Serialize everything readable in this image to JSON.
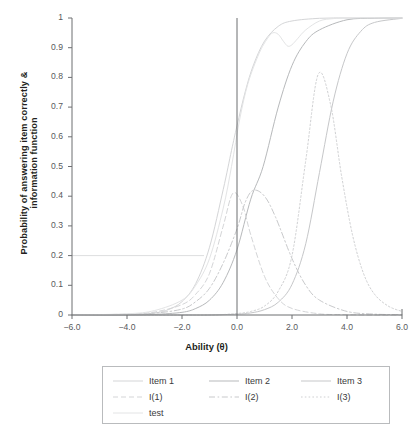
{
  "chart_data": {
    "type": "line",
    "title": "",
    "xlabel": "Ability (θ)",
    "ylabel": "Probability of answering item correctly & information function",
    "xlim": [
      -6.0,
      6.0
    ],
    "ylim": [
      0,
      1
    ],
    "xticks": [
      "-6.0",
      "-4.0",
      "-2.0",
      "0.0",
      "2.0",
      "4.0",
      "6.0"
    ],
    "xtick_values": [
      -6.0,
      -4.0,
      -2.0,
      0.0,
      2.0,
      4.0,
      6.0
    ],
    "yticks": [
      "0",
      "0.1",
      "0.2",
      "0.3",
      "0.4",
      "0.5",
      "0.6",
      "0.7",
      "0.8",
      "0.9",
      "1"
    ],
    "ytick_values": [
      0,
      0.1,
      0.2,
      0.3,
      0.4,
      0.5,
      0.6,
      0.7,
      0.8,
      0.9,
      1
    ],
    "grid": false,
    "legend_position": "bottom",
    "reference_lines": [
      {
        "name": "theta-zero-vertical",
        "orientation": "vertical",
        "value": 0.0,
        "color": "#6d6e71"
      },
      {
        "name": "probability-0.2-horizontal",
        "orientation": "horizontal",
        "value": 0.2,
        "x_from": -6.0,
        "x_to": -1.2,
        "color": "#d9dadb"
      }
    ],
    "series": [
      {
        "name": "Item 1",
        "style": "solid",
        "color": "#d4d5d7",
        "model": "2pl",
        "a": 1.8,
        "b": -0.15,
        "c": 0.0,
        "x": [
          -6.0,
          -5.0,
          -4.0,
          -3.0,
          -2.5,
          -2.0,
          -1.5,
          -1.0,
          -0.5,
          -0.2,
          0.0,
          0.3,
          0.6,
          1.0,
          1.5,
          2.0,
          3.0,
          4.0,
          5.0,
          6.0
        ],
        "y": [
          0.0,
          0.0,
          0.001,
          0.007,
          0.018,
          0.045,
          0.106,
          0.228,
          0.423,
          0.554,
          0.637,
          0.752,
          0.842,
          0.922,
          0.972,
          0.99,
          0.999,
          1.0,
          1.0,
          1.0
        ]
      },
      {
        "name": "Item 2",
        "style": "solid",
        "color": "#b7b9bb",
        "model": "2pl",
        "a": 1.6,
        "b": 0.95,
        "c": 0.0,
        "x": [
          -6.0,
          -5.0,
          -4.0,
          -3.0,
          -2.0,
          -1.5,
          -1.0,
          -0.5,
          0.0,
          0.5,
          0.95,
          1.5,
          2.0,
          2.5,
          3.0,
          4.0,
          5.0,
          6.0
        ],
        "y": [
          0.0,
          0.0,
          0.0,
          0.002,
          0.009,
          0.022,
          0.05,
          0.11,
          0.22,
          0.39,
          0.5,
          0.7,
          0.84,
          0.92,
          0.96,
          0.994,
          0.999,
          1.0
        ]
      },
      {
        "name": "Item 3",
        "style": "solid",
        "color": "#c6c7c9",
        "model": "2pl",
        "a": 1.9,
        "b": 3.05,
        "c": 0.0,
        "x": [
          -6.0,
          -4.0,
          -2.0,
          -1.0,
          0.0,
          0.5,
          1.0,
          1.5,
          2.0,
          2.5,
          3.0,
          3.5,
          4.0,
          4.5,
          5.0,
          6.0
        ],
        "y": [
          0.0,
          0.0,
          0.0,
          0.0,
          0.003,
          0.007,
          0.018,
          0.043,
          0.103,
          0.24,
          0.48,
          0.72,
          0.88,
          0.955,
          0.985,
          0.999
        ]
      },
      {
        "name": "I(1)",
        "style": "dashed",
        "color": "#d4d5d7",
        "peak_x": -0.15,
        "peak_y": 0.41,
        "x": [
          -6.0,
          -4.0,
          -3.0,
          -2.0,
          -1.5,
          -1.0,
          -0.5,
          -0.15,
          0.2,
          0.5,
          1.0,
          1.5,
          2.0,
          3.0,
          4.0,
          5.0,
          6.0
        ],
        "y": [
          0.0,
          0.003,
          0.01,
          0.035,
          0.07,
          0.14,
          0.3,
          0.41,
          0.37,
          0.27,
          0.13,
          0.055,
          0.022,
          0.004,
          0.001,
          0.0,
          0.0
        ]
      },
      {
        "name": "I(2)",
        "style": "dashdot",
        "color": "#c8c9cb",
        "peak_x": 0.6,
        "peak_y": 0.42,
        "x": [
          -6.0,
          -4.0,
          -3.0,
          -2.0,
          -1.5,
          -1.0,
          -0.5,
          0.0,
          0.3,
          0.6,
          1.0,
          1.4,
          2.0,
          2.5,
          3.0,
          4.0,
          5.0,
          6.0
        ],
        "y": [
          0.0,
          0.002,
          0.006,
          0.02,
          0.045,
          0.09,
          0.175,
          0.29,
          0.38,
          0.42,
          0.4,
          0.33,
          0.19,
          0.1,
          0.05,
          0.012,
          0.003,
          0.001
        ]
      },
      {
        "name": "I(3)",
        "style": "dotted",
        "color": "#cfd0d2",
        "peak_x": 2.95,
        "peak_y": 0.81,
        "x": [
          -6.0,
          -3.0,
          -1.0,
          0.0,
          0.5,
          1.0,
          1.5,
          2.0,
          2.5,
          2.95,
          3.4,
          3.8,
          4.2,
          4.6,
          5.0,
          5.5,
          6.0
        ],
        "y": [
          0.0,
          0.0,
          0.0,
          0.005,
          0.012,
          0.03,
          0.08,
          0.2,
          0.52,
          0.81,
          0.71,
          0.47,
          0.27,
          0.14,
          0.07,
          0.03,
          0.012
        ]
      },
      {
        "name": "test",
        "style": "solid",
        "color": "#e3e4e5",
        "x": [
          -6.0,
          -4.0,
          -3.0,
          -2.0,
          -1.5,
          -1.0,
          -0.5,
          -0.2,
          0.1,
          0.4,
          0.8,
          1.1,
          1.3,
          1.5,
          1.7,
          1.85,
          2.0,
          2.2,
          2.5,
          3.0,
          3.5,
          4.0,
          5.0,
          6.0
        ],
        "y": [
          0.0,
          0.004,
          0.015,
          0.05,
          0.1,
          0.19,
          0.36,
          0.5,
          0.66,
          0.78,
          0.88,
          0.93,
          0.95,
          0.945,
          0.92,
          0.905,
          0.91,
          0.93,
          0.96,
          0.99,
          0.998,
          1.0,
          1.0,
          1.0
        ]
      }
    ]
  },
  "legend": {
    "entries": [
      {
        "label": "Item 1",
        "style": "solid",
        "color": "#d4d5d7"
      },
      {
        "label": "Item 2",
        "style": "solid",
        "color": "#b7b9bb"
      },
      {
        "label": "Item 3",
        "style": "solid",
        "color": "#c6c7c9"
      },
      {
        "label": "I(1)",
        "style": "dashed",
        "color": "#d4d5d7"
      },
      {
        "label": "I(2)",
        "style": "dashdot",
        "color": "#c8c9cb"
      },
      {
        "label": "I(3)",
        "style": "dotted",
        "color": "#cfd0d2"
      },
      {
        "label": "test",
        "style": "solid",
        "color": "#e3e4e5"
      }
    ]
  },
  "axes": {
    "x_title": "Ability (θ)",
    "y_title_line1": "Probability of answering item correctly &",
    "y_title_line2": "information function"
  },
  "colors": {
    "axis": "#6d6e71",
    "tick_text": "#58595b",
    "title_text": "#231f20",
    "legend_border": "#b9bbbd",
    "background": "#ffffff"
  }
}
